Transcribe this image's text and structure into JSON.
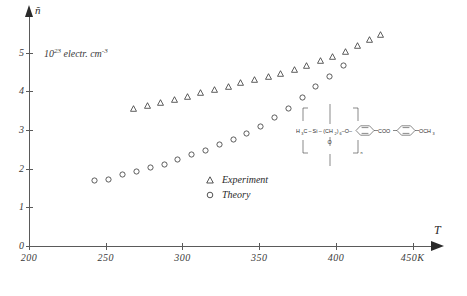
{
  "figure": {
    "background": "#ffffff",
    "line_color": "#5a5a5a",
    "text_color": "#2a2a2a"
  },
  "axes": {
    "y_axis_title": "ñ",
    "x_axis_title": "T",
    "y_unit_note_main": "10",
    "y_unit_note_exp": "23",
    "y_unit_note_rest": " electr. cm",
    "y_unit_note_rest_exp": "-3",
    "y_ticks": [
      "0",
      "1",
      "2",
      "3",
      "4",
      "5"
    ],
    "x_ticks": [
      "200",
      "250",
      "300",
      "350",
      "400",
      "450K"
    ]
  },
  "legend": {
    "items": [
      {
        "symbol": "triangle",
        "label": "Experiment"
      },
      {
        "symbol": "circle",
        "label": "Theory"
      }
    ]
  },
  "chemical_structure": {
    "label": "side-chain liquid crystal polysiloxane",
    "left_group": "H",
    "left_group_sub": "3",
    "left_group_2": "C",
    "dash1": "–",
    "si": "Si",
    "dash2": "–",
    "chain_open": "(CH",
    "chain_sub": "2",
    "chain_close": ")",
    "chain_n": "6",
    "o_link": "–O–",
    "coo": "COO",
    "o_bridge": "–",
    "tail": "–OCH",
    "tail_sub": "3",
    "si_o": "O",
    "repeat_subscript": "n"
  },
  "chart_data": {
    "type": "scatter",
    "title": "",
    "xlabel": "T",
    "ylabel": "ñ",
    "ylabel_units": "10^23 electr. cm^-3",
    "xlim": [
      200,
      460
    ],
    "ylim": [
      0,
      5.9
    ],
    "xticks": [
      200,
      250,
      300,
      350,
      400,
      450
    ],
    "yticks": [
      0,
      1,
      2,
      3,
      4,
      5
    ],
    "grid": false,
    "legend_position": "center",
    "series": [
      {
        "name": "Experiment",
        "marker": "triangle",
        "x": [
          268,
          277,
          286,
          295,
          303,
          312,
          321,
          330,
          338,
          347,
          356,
          364,
          373,
          381,
          390,
          398,
          406,
          414,
          422,
          429
        ],
        "y": [
          3.56,
          3.64,
          3.72,
          3.8,
          3.88,
          3.98,
          4.06,
          4.13,
          4.22,
          4.3,
          4.38,
          4.47,
          4.57,
          4.68,
          4.79,
          4.91,
          5.03,
          5.18,
          5.34,
          5.48
        ]
      },
      {
        "name": "Theory",
        "marker": "circle",
        "x": [
          243,
          252,
          261,
          270,
          279,
          288,
          297,
          306,
          315,
          324,
          333,
          342,
          351,
          360,
          369,
          378,
          387,
          396,
          405
        ],
        "y": [
          1.7,
          1.72,
          1.84,
          1.93,
          2.03,
          2.12,
          2.24,
          2.36,
          2.48,
          2.62,
          2.76,
          2.92,
          3.1,
          3.32,
          3.56,
          3.84,
          4.12,
          4.38,
          4.66
        ]
      }
    ]
  }
}
